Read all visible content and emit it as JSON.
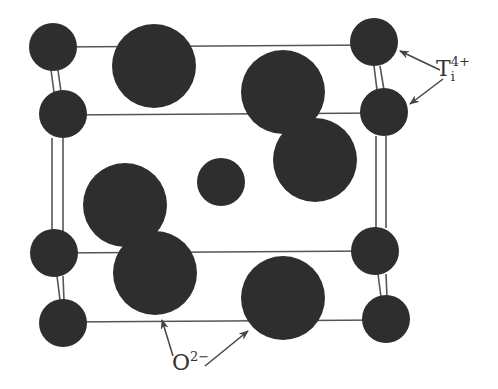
{
  "colors": {
    "atom_fill": "#2e2e2e",
    "line": "#555555",
    "background": "#ffffff",
    "label": "#333333"
  },
  "labels": {
    "titanium": {
      "base": "T",
      "sub": "i",
      "sup": "4+"
    },
    "oxygen": {
      "base": "O",
      "sup": "2−"
    }
  },
  "atoms": {
    "titanium": [
      {
        "id": "ti-top-back-left",
        "cx": 53,
        "cy": 47,
        "r": 24
      },
      {
        "id": "ti-top-front-left",
        "cx": 63,
        "cy": 114,
        "r": 24
      },
      {
        "id": "ti-top-back-right",
        "cx": 374,
        "cy": 42,
        "r": 24
      },
      {
        "id": "ti-top-front-right",
        "cx": 384,
        "cy": 112,
        "r": 24
      },
      {
        "id": "ti-center",
        "cx": 221,
        "cy": 182,
        "r": 24
      },
      {
        "id": "ti-bottom-back-left",
        "cx": 54,
        "cy": 253,
        "r": 24
      },
      {
        "id": "ti-bottom-front-left",
        "cx": 63,
        "cy": 323,
        "r": 24
      },
      {
        "id": "ti-bottom-back-right",
        "cx": 375,
        "cy": 251,
        "r": 24
      },
      {
        "id": "ti-bottom-front-right",
        "cx": 386,
        "cy": 319,
        "r": 24
      }
    ],
    "oxygen": [
      {
        "id": "o-top-left",
        "cx": 154,
        "cy": 66,
        "r": 42
      },
      {
        "id": "o-upper-right-a",
        "cx": 283,
        "cy": 92,
        "r": 42
      },
      {
        "id": "o-upper-right-b",
        "cx": 315,
        "cy": 160,
        "r": 42
      },
      {
        "id": "o-lower-left-a",
        "cx": 125,
        "cy": 205,
        "r": 42
      },
      {
        "id": "o-lower-left-b",
        "cx": 155,
        "cy": 273,
        "r": 42
      },
      {
        "id": "o-bottom-right",
        "cx": 283,
        "cy": 298,
        "r": 42
      }
    ]
  },
  "edges": [
    {
      "x1": 53,
      "y1": 47,
      "x2": 374,
      "y2": 45
    },
    {
      "x1": 63,
      "y1": 115,
      "x2": 384,
      "y2": 113
    },
    {
      "x1": 54,
      "y1": 253,
      "x2": 375,
      "y2": 251
    },
    {
      "x1": 63,
      "y1": 322,
      "x2": 386,
      "y2": 320
    },
    {
      "x1": 51,
      "y1": 70,
      "x2": 54,
      "y2": 92
    },
    {
      "x1": 58,
      "y1": 70,
      "x2": 61,
      "y2": 92
    },
    {
      "x1": 52,
      "y1": 138,
      "x2": 52,
      "y2": 232
    },
    {
      "x1": 63,
      "y1": 138,
      "x2": 63,
      "y2": 232
    },
    {
      "x1": 57,
      "y1": 276,
      "x2": 60,
      "y2": 300
    },
    {
      "x1": 63,
      "y1": 276,
      "x2": 64,
      "y2": 300
    },
    {
      "x1": 374,
      "y1": 66,
      "x2": 377,
      "y2": 90
    },
    {
      "x1": 380,
      "y1": 66,
      "x2": 384,
      "y2": 90
    },
    {
      "x1": 376,
      "y1": 136,
      "x2": 376,
      "y2": 228
    },
    {
      "x1": 386,
      "y1": 136,
      "x2": 386,
      "y2": 228
    },
    {
      "x1": 378,
      "y1": 274,
      "x2": 381,
      "y2": 297
    },
    {
      "x1": 386,
      "y1": 274,
      "x2": 387,
      "y2": 297
    }
  ],
  "arrows": [
    {
      "target": "ti-top-back-right",
      "x1": 440,
      "y1": 70,
      "x2": 400,
      "y2": 51
    },
    {
      "target": "ti-top-front-right",
      "x1": 443,
      "y1": 79,
      "x2": 410,
      "y2": 104
    },
    {
      "target": "o-lower-left-b",
      "x1": 173,
      "y1": 356,
      "x2": 162,
      "y2": 320
    },
    {
      "target": "o-bottom-right",
      "x1": 205,
      "y1": 366,
      "x2": 248,
      "y2": 331
    }
  ]
}
